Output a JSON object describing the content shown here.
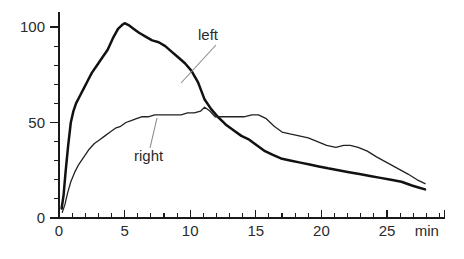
{
  "figure": {
    "width": 464,
    "height": 259,
    "background": "#ffffff"
  },
  "chart_data": {
    "type": "line",
    "title": "",
    "subtitle": "",
    "xlabel": "min",
    "ylabel": "",
    "xlim": [
      -0.35,
      29.4
    ],
    "ylim": [
      0,
      108
    ],
    "grid": false,
    "legend_position": "inline-annotations",
    "x_ticks_major": [
      0,
      5,
      10,
      15,
      20,
      25
    ],
    "x_tick_labels": [
      "0",
      "5",
      "10",
      "15",
      "20",
      "25"
    ],
    "x_tick_minor_step": 1,
    "y_ticks_major": [
      0,
      50,
      100
    ],
    "y_tick_labels": [
      "0",
      "50",
      "100"
    ],
    "y_tick_minor_step": 10,
    "annotations": [
      {
        "text": "left",
        "label_x": 198,
        "label_y": 40,
        "leader_from_x": 216,
        "leader_from_y": 45,
        "leader_to_x": 181,
        "leader_to_y": 83,
        "series": "left"
      },
      {
        "text": "right",
        "label_x": 134,
        "label_y": 161,
        "leader_from_x": 150,
        "leader_from_y": 148,
        "leader_to_x": 157,
        "leader_to_y": 118,
        "series": "right"
      }
    ],
    "series": [
      {
        "name": "left",
        "style": "thick",
        "color": "#111111",
        "x": [
          0.2,
          0.35,
          0.5,
          0.7,
          0.9,
          1.1,
          1.3,
          1.6,
          1.9,
          2.2,
          2.5,
          2.9,
          3.3,
          3.7,
          4.1,
          4.5,
          4.8,
          5.0,
          5.3,
          5.7,
          6.1,
          6.6,
          7.1,
          7.6,
          8.1,
          8.6,
          9.1,
          9.6,
          10.1,
          10.6,
          11.1,
          11.6,
          12.1,
          12.7,
          13.3,
          13.9,
          14.5,
          15.1,
          15.7,
          16.3,
          17.0,
          17.7,
          18.4,
          19.1,
          19.8,
          20.5,
          21.3,
          22.1,
          22.9,
          23.7,
          24.5,
          25.3,
          26.1,
          26.9,
          27.4,
          27.9
        ],
        "y": [
          5,
          12,
          24,
          38,
          50,
          56,
          60,
          64,
          68,
          72,
          76,
          80,
          84,
          88,
          94,
          99,
          101,
          102,
          101,
          99,
          97,
          95,
          93,
          92,
          90,
          87,
          84,
          81,
          77,
          71,
          62,
          57,
          53,
          49,
          46,
          43,
          41,
          38,
          35,
          33,
          31,
          30,
          29,
          28,
          27,
          26,
          25,
          24,
          23,
          22,
          21,
          20,
          19,
          17,
          16,
          15
        ]
      },
      {
        "name": "right",
        "style": "thin",
        "color": "#222222",
        "x": [
          0.25,
          0.45,
          0.65,
          0.9,
          1.2,
          1.5,
          1.9,
          2.3,
          2.7,
          3.1,
          3.5,
          3.9,
          4.3,
          4.7,
          5.1,
          5.5,
          5.9,
          6.3,
          6.8,
          7.3,
          7.8,
          8.3,
          8.8,
          9.3,
          9.8,
          10.3,
          10.8,
          11.1,
          11.5,
          11.9,
          12.4,
          12.9,
          13.5,
          14.1,
          14.7,
          15.2,
          15.8,
          16.4,
          17.0,
          17.6,
          18.3,
          19.0,
          19.7,
          20.4,
          21.1,
          21.7,
          22.2,
          22.8,
          23.5,
          24.2,
          25.0,
          25.8,
          26.6,
          27.3,
          27.9
        ],
        "y": [
          3,
          7,
          13,
          19,
          24,
          28,
          32,
          36,
          39,
          41,
          43,
          45,
          47,
          48,
          50,
          51,
          52,
          53,
          53,
          54,
          54,
          54,
          54,
          54,
          55,
          55,
          56,
          58,
          56,
          53,
          53,
          53,
          53,
          53,
          54,
          54,
          52,
          48,
          45,
          44,
          43,
          42,
          40,
          38,
          37,
          38,
          38,
          37,
          35,
          32,
          29,
          26,
          23,
          20,
          18
        ]
      }
    ]
  }
}
